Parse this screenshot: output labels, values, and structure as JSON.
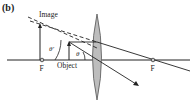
{
  "figure": {
    "panel_label": "(b)",
    "labels": {
      "image": "Image",
      "object": "Object",
      "focal_left": "F",
      "focal_right": "F",
      "angle_outer": "θ′",
      "angle_inner": "θ"
    },
    "colors": {
      "line": "#222222",
      "lens_fill": "#bdbdbd",
      "lens_stroke": "#555555",
      "focal_fill": "#cccccc"
    }
  }
}
